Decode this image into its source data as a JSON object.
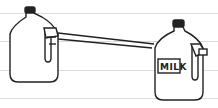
{
  "illustration": {
    "description": "Two milk jugs connected by a horizontal tube",
    "right_jug_label": "MILK",
    "colors": {
      "line": "#222222",
      "cap": "#222222",
      "ruled_lines": "#dcdcdc",
      "background": "#ffffff"
    }
  }
}
